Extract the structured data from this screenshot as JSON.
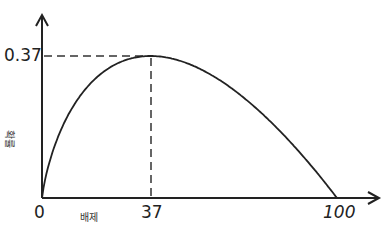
{
  "chart_data": {
    "type": "line",
    "title": "",
    "xlabel": "배제",
    "ylabel": "확률",
    "x_ticks": [
      "0",
      "37",
      "100"
    ],
    "y_ticks": [
      "0.37"
    ],
    "xlim": [
      0,
      100
    ],
    "ylim": [
      0,
      0.37
    ],
    "grid": false,
    "series": [
      {
        "name": "success probability",
        "x": [
          0,
          5,
          10,
          20,
          30,
          37,
          45,
          50,
          60,
          70,
          80,
          90,
          100
        ],
        "values": [
          0,
          0.15,
          0.23,
          0.32,
          0.36,
          0.37,
          0.36,
          0.35,
          0.31,
          0.25,
          0.18,
          0.09,
          0
        ]
      }
    ],
    "annotations": [
      {
        "type": "dashed-guide",
        "x": 37,
        "y": 0.37,
        "label": "peak at x=37, y=0.37"
      }
    ]
  },
  "labels": {
    "y_tick": "0.37",
    "x_origin": "0",
    "x_peak": "37",
    "x_end": "100",
    "x_axis": "배제",
    "y_axis": "확률"
  }
}
